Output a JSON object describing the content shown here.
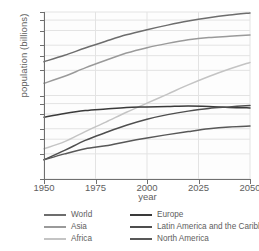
{
  "chart_data": {
    "type": "line",
    "title": "",
    "xlabel": "year",
    "ylabel": "population (billions)",
    "yscale": "log",
    "ylim": [
      0.1,
      10
    ],
    "xlim": [
      1950,
      2050
    ],
    "grid": true,
    "legend_position": "bottom",
    "xticks": [
      1950,
      1975,
      2000,
      2025,
      2050
    ],
    "yticks": [
      0.1,
      0.2,
      0.3,
      0.4,
      0.6,
      0.8,
      1,
      2,
      3,
      4,
      6,
      8,
      10
    ],
    "ytick_labels": [
      "0.1",
      "0.2",
      "0.3",
      "0.4",
      "0.6",
      "0.8",
      "1",
      "2",
      "3",
      "4",
      "6",
      "8",
      "10"
    ],
    "x": [
      1950,
      1960,
      1970,
      1980,
      1990,
      2000,
      2010,
      2020,
      2030,
      2040,
      2050
    ],
    "series": [
      {
        "name": "World",
        "color": "#6d6d6d",
        "values": [
          2.54,
          3.03,
          3.7,
          4.46,
          5.33,
          6.14,
          6.96,
          7.79,
          8.55,
          9.2,
          9.74
        ]
      },
      {
        "name": "Asia",
        "color": "#9a9a9a",
        "values": [
          1.4,
          1.7,
          2.14,
          2.64,
          3.22,
          3.74,
          4.21,
          4.64,
          4.95,
          5.12,
          5.29
        ]
      },
      {
        "name": "Africa",
        "color": "#c4c4c4",
        "values": [
          0.23,
          0.28,
          0.37,
          0.48,
          0.63,
          0.81,
          1.04,
          1.34,
          1.69,
          2.08,
          2.49
        ]
      },
      {
        "name": "Europe",
        "color": "#3a3a3a",
        "values": [
          0.55,
          0.61,
          0.66,
          0.69,
          0.72,
          0.73,
          0.74,
          0.75,
          0.74,
          0.72,
          0.71
        ]
      },
      {
        "name": "Latin America and the Caribbean",
        "color": "#4e4e4e",
        "values": [
          0.17,
          0.22,
          0.29,
          0.36,
          0.44,
          0.52,
          0.59,
          0.65,
          0.7,
          0.73,
          0.76
        ]
      },
      {
        "name": "North America",
        "color": "#585858",
        "values": [
          0.17,
          0.2,
          0.23,
          0.25,
          0.28,
          0.31,
          0.34,
          0.37,
          0.4,
          0.42,
          0.43
        ]
      }
    ]
  },
  "legend": {
    "items": [
      {
        "label": "World",
        "color": "#6d6d6d"
      },
      {
        "label": "Europe",
        "color": "#3a3a3a"
      },
      {
        "label": "Asia",
        "color": "#9a9a9a"
      },
      {
        "label": "Latin America and the Caribbean",
        "color": "#4e4e4e"
      },
      {
        "label": "Africa",
        "color": "#c4c4c4"
      },
      {
        "label": "North America",
        "color": "#585858"
      }
    ]
  },
  "style": {
    "grid_color": "#e3e3e3",
    "axis_color": "#6f6f6f",
    "text_color": "#5e5e5e",
    "plot_bg": "#fdfdfd"
  }
}
